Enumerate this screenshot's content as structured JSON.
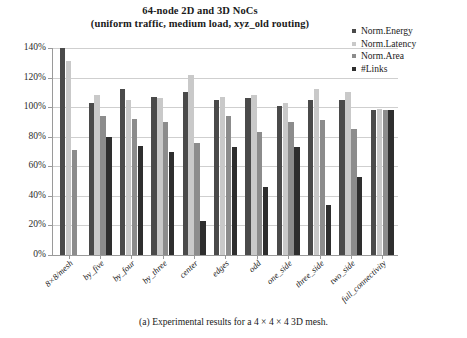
{
  "figure": {
    "title_line1": "64-node 2D and 3D NoCs",
    "title_line2": "(uniform traffic, medium load, xyz_old routing)",
    "caption": "(a) Experimental results for a 4 × 4 × 4 3D mesh."
  },
  "chart_data": {
    "type": "bar",
    "title": "64-node 2D and 3D NoCs (uniform traffic, medium load, xyz_old routing)",
    "xlabel": "",
    "ylabel": "",
    "ylim": [
      0,
      140
    ],
    "ytick_values": [
      0,
      20,
      40,
      60,
      80,
      100,
      120,
      140
    ],
    "ytick_labels": [
      "0%",
      "20%",
      "40%",
      "60%",
      "80%",
      "100%",
      "120%",
      "140%"
    ],
    "grid": true,
    "legend_position": "top-right",
    "categories": [
      "8×8/mesh",
      "by_five",
      "by_four",
      "by_three",
      "center",
      "edges",
      "odd",
      "one_side",
      "three_side",
      "two_side",
      "full_connectivity"
    ],
    "series": [
      {
        "name": "Norm.Energy",
        "color": "#4a4a4a",
        "values": [
          140,
          103,
          112,
          107,
          110,
          105,
          106,
          101,
          105,
          105,
          98
        ]
      },
      {
        "name": "Norm.Latency",
        "color": "#c9c9c9",
        "values": [
          131,
          108,
          105,
          106,
          122,
          107,
          108,
          103,
          112,
          110,
          99
        ]
      },
      {
        "name": "Norm.Area",
        "color": "#8c8c8c",
        "values": [
          71,
          94,
          92,
          90,
          76,
          94,
          83,
          90,
          91,
          85,
          98
        ]
      },
      {
        "name": "#Links",
        "color": "#2e2e2e",
        "values": [
          null,
          80,
          74,
          70,
          23,
          73,
          46,
          73,
          34,
          53,
          98
        ]
      }
    ]
  }
}
